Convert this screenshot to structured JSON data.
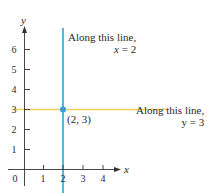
{
  "diagram": {
    "axes": {
      "x_label": "x",
      "y_label": "y",
      "origin_label": "0",
      "x_ticks": [
        "1",
        "2",
        "3",
        "4"
      ],
      "y_ticks": [
        "1",
        "2",
        "3",
        "4",
        "5",
        "6"
      ]
    },
    "vertical_line": {
      "x_value": 2,
      "color": "#3a9fd0",
      "label_line1": "Along this line,",
      "label_line2_var": "x",
      "label_line2_rest": " = 2"
    },
    "horizontal_line": {
      "y_value": 3,
      "color": "#f2cf5b",
      "label_line1": "Along this line,",
      "label_line2_var": "y",
      "label_line2_rest": " = 3"
    },
    "point": {
      "label": "(2, 3)",
      "color": "#3a9fd0"
    }
  }
}
